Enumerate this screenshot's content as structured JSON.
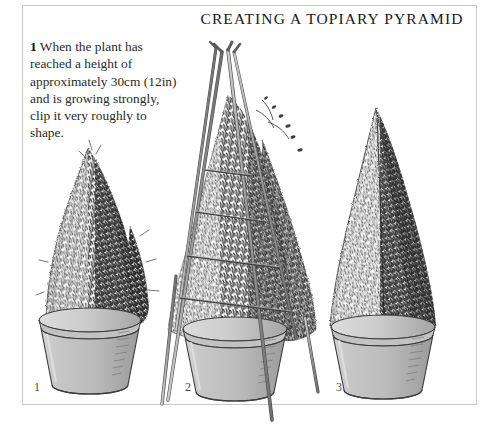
{
  "page": {
    "title": "CREATING A TOPIARY PYRAMID",
    "background_color": "#ffffff",
    "frame_color": "#c9c9c9",
    "ink_color": "#1a1a1a"
  },
  "caption": {
    "step_number": "1",
    "text": " When the plant has reached a height of approximately 30cm (12in) and is growing strongly, clip it very roughly to shape."
  },
  "figures": [
    {
      "number": "1",
      "name": "rough-clipped-shrub",
      "description": "Bushy conical shrub, roughly clipped, growing in a tapered plastic pot",
      "pot_color": "#b9b9b9",
      "foliage_color": "#3a3a3a"
    },
    {
      "number": "2",
      "name": "cane-wigwam-frame",
      "description": "Plant with a three-cane wigwam frame tied with horizontal strings to guide the pyramid shape",
      "pot_color": "#b9b9b9",
      "cane_color": "#8a8a8a",
      "foliage_color": "#3a3a3a"
    },
    {
      "number": "3",
      "name": "finished-topiary-pyramid",
      "description": "Finished neatly clipped topiary pyramid in a pot",
      "pot_color": "#b9b9b9",
      "foliage_color": "#3a3a3a"
    }
  ]
}
